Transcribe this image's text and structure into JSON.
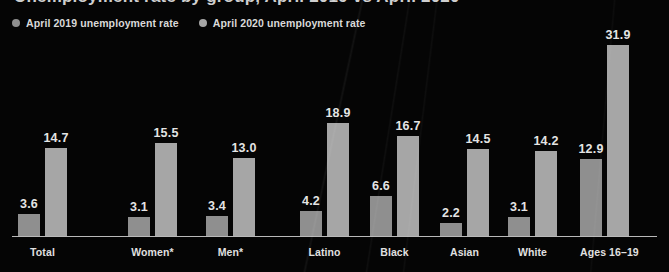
{
  "chart_data": {
    "type": "bar",
    "title": "Unemployment rate by group, April 2019 vs April 2020",
    "xlabel": "",
    "ylabel": "",
    "ylim": [
      0,
      34
    ],
    "grid": false,
    "legend_position": "top-left",
    "categories": [
      "Total",
      "Women*",
      "Men*",
      "Latino",
      "Black",
      "Asian",
      "White",
      "Ages 16–19"
    ],
    "series": [
      {
        "name": "April 2019 unemployment rate",
        "color": "#8f8f8f",
        "values": [
          3.6,
          3.1,
          3.4,
          4.2,
          6.6,
          2.2,
          3.1,
          12.9
        ]
      },
      {
        "name": "April 2020 unemployment rate",
        "color": "#a6a6a6",
        "values": [
          14.7,
          15.5,
          13.0,
          18.9,
          16.7,
          14.5,
          14.2,
          31.9
        ]
      }
    ],
    "value_labels": [
      [
        "3.6",
        "14.7"
      ],
      [
        "3.1",
        "15.5"
      ],
      [
        "3.4",
        "13.0"
      ],
      [
        "4.2",
        "18.9"
      ],
      [
        "6.6",
        "16.7"
      ],
      [
        "2.2",
        "14.5"
      ],
      [
        "3.1",
        "14.2"
      ],
      [
        "12.9",
        "31.9"
      ]
    ],
    "background_color": "#050505",
    "axis_color": "#b9b9b9",
    "text_color": "#e4e4e4"
  },
  "legend": {
    "items": [
      {
        "label": "April 2019 unemployment rate",
        "color": "#8f8f8f"
      },
      {
        "label": "April 2020 unemployment rate",
        "color": "#a6a6a6"
      }
    ]
  },
  "layout": {
    "group_left": [
      18,
      128,
      206,
      300,
      370,
      440,
      508,
      580
    ],
    "baseline_y": 236,
    "px_per_unit": 6.0
  }
}
